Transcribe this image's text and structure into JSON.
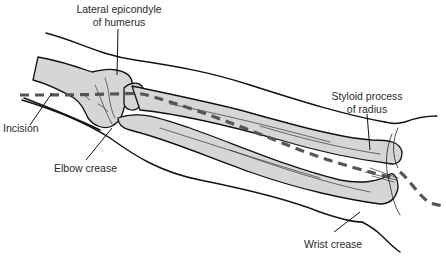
{
  "figure": {
    "type": "anatomical-illustration",
    "colors": {
      "bone_fill": "#d6d6d6",
      "outline": "#111111",
      "incision_dash": "#555555",
      "label_text": "#2a2a2a"
    }
  },
  "labels": {
    "lateral_epicondyle": {
      "line1": "Lateral epicondyle",
      "line2": "of humerus"
    },
    "incision": "Incision",
    "elbow_crease": "Elbow crease",
    "styloid_process": {
      "line1": "Styloid process",
      "line2": "of radius"
    },
    "wrist_crease": "Wrist crease"
  }
}
